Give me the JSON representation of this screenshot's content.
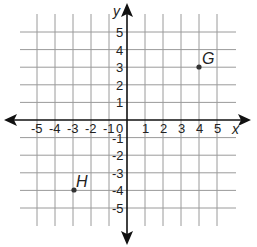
{
  "chart_data": {
    "type": "scatter",
    "title": "",
    "xlabel": "x",
    "ylabel": "y",
    "xlim": [
      -5,
      5
    ],
    "ylim": [
      -5,
      5
    ],
    "grid": true,
    "legend": null,
    "x_ticks": [
      "-5",
      "-4",
      "-3",
      "-2",
      "-1",
      "0",
      "1",
      "2",
      "3",
      "4",
      "5"
    ],
    "y_ticks": [
      "5",
      "4",
      "3",
      "2",
      "1",
      "-1",
      "-2",
      "-3",
      "-4",
      "-5"
    ],
    "points": [
      {
        "label": "G",
        "x": 4,
        "y": 3
      },
      {
        "label": "H",
        "x": -3,
        "y": -4
      }
    ]
  },
  "axes": {
    "x_name": "x",
    "y_name": "y",
    "origin_label": "0"
  },
  "labels": {
    "x_neg": [
      "-5",
      "-4",
      "-3",
      "-2",
      "-1"
    ],
    "x_pos": [
      "1",
      "2",
      "3",
      "4",
      "5"
    ],
    "y_pos": [
      "1",
      "2",
      "3",
      "4",
      "5"
    ],
    "y_neg": [
      "-1",
      "-2",
      "-3",
      "-4",
      "-5"
    ]
  },
  "points": {
    "G": {
      "name": "G"
    },
    "H": {
      "name": "H"
    }
  },
  "colors": {
    "grid": "#9a9a9a",
    "axis": "#111111",
    "point": "#333333"
  }
}
